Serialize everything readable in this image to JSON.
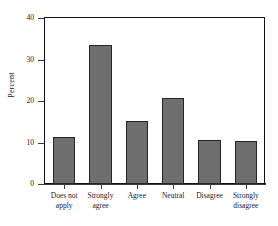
{
  "chart_data": {
    "type": "bar",
    "title": "",
    "xlabel": "",
    "ylabel": "Percent",
    "ylim": [
      0,
      40
    ],
    "yticks": [
      "0",
      "10",
      "20",
      "30",
      "40"
    ],
    "ytick_values": [
      0,
      10,
      20,
      30,
      40
    ],
    "grid": false,
    "legend": false,
    "categories": [
      "Does not\napply",
      "Strongly\nagree",
      "Agree",
      "Neutral",
      "Disagree",
      "Strongly\ndisagree"
    ],
    "values": [
      11.4,
      33.4,
      15.2,
      20.8,
      10.7,
      10.3
    ],
    "bar_color": "#6e6e6e",
    "bar_edge_color": "#262626",
    "axis_color": "#3a3a3a",
    "frame_color": "#111111",
    "background": "#ffffff"
  }
}
